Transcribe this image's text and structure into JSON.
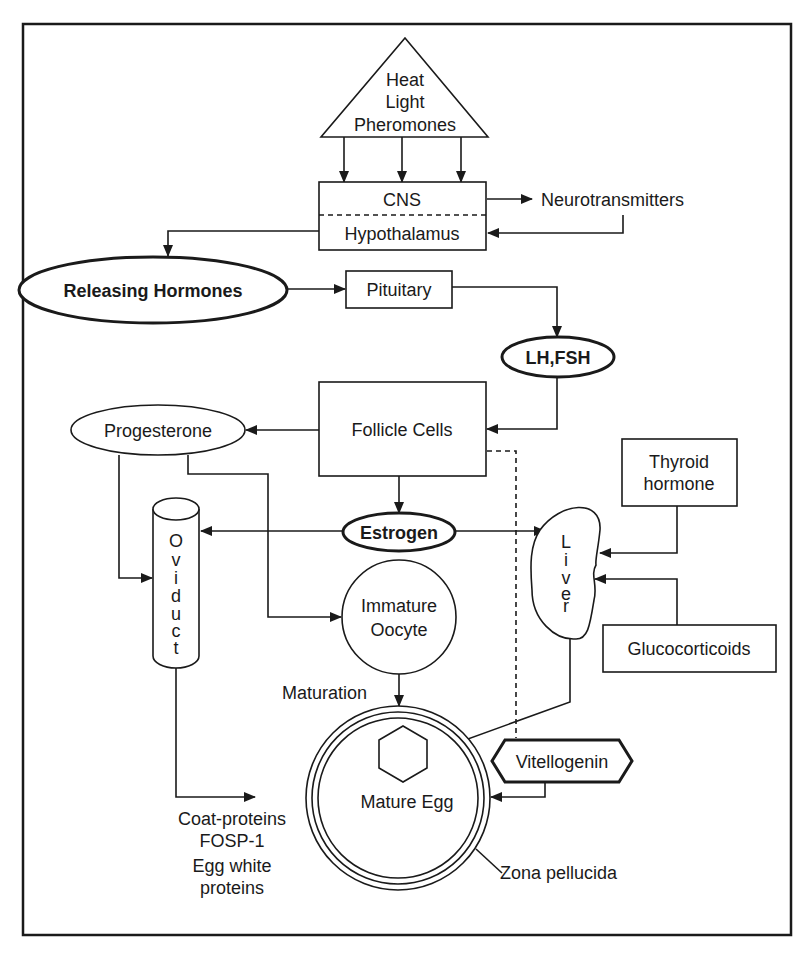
{
  "diagram": {
    "colors": {
      "stroke": "#1a1a1a",
      "background": "#ffffff"
    },
    "stimuli": {
      "lines": [
        "Heat",
        "Light",
        "Pheromones"
      ],
      "shape": "triangle"
    },
    "cns_box": {
      "top": "CNS",
      "bottom": "Hypothalamus"
    },
    "neurotransmitters": "Neurotransmitters",
    "releasing_hormones": "Releasing Hormones",
    "pituitary": "Pituitary",
    "lh_fsh": "LH,FSH",
    "follicle_cells": "Follicle Cells",
    "progesterone": "Progesterone",
    "estrogen": "Estrogen",
    "oviduct": {
      "letters": [
        "O",
        "v",
        "i",
        "d",
        "u",
        "c",
        "t"
      ],
      "label": "Oviduct"
    },
    "liver": {
      "letters": [
        "L",
        "i",
        "v",
        "e",
        "r"
      ],
      "label": "Liver"
    },
    "thyroid": {
      "lines": [
        "Thyroid",
        "hormone"
      ]
    },
    "glucocorticoids": "Glucocorticoids",
    "immature_oocyte": {
      "lines": [
        "Immature",
        "Oocyte"
      ]
    },
    "maturation": "Maturation",
    "mature_egg": "Mature Egg",
    "vitellogenin": "Vitellogenin",
    "zona_pellucida": "Zona pellucida",
    "coat_proteins": {
      "lines": [
        "Coat-proteins",
        "FOSP-1",
        "Egg white",
        "proteins"
      ]
    }
  }
}
